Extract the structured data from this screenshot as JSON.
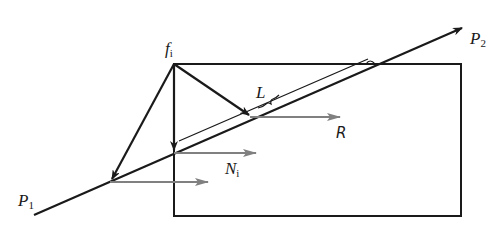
{
  "colors": {
    "stroke": "#1a1a1a",
    "force_arrow": "#808080",
    "background": "#ffffff"
  },
  "labels": {
    "f_i": {
      "main": "f",
      "sub": "i"
    },
    "P2": {
      "main": "P",
      "sub": "2"
    },
    "P1": {
      "main": "P",
      "sub": "1"
    },
    "L": {
      "main": "L"
    },
    "R": {
      "main": "R"
    },
    "N_i": {
      "main": "N",
      "sub": "i"
    }
  },
  "geometry": {
    "rectangle": {
      "x1": 174,
      "y1": 64,
      "x2": 461,
      "y2": 216
    },
    "line_P1_P2": {
      "from": [
        34,
        215
      ],
      "to": [
        462,
        28
      ]
    },
    "apex_f_i": [
      174,
      64
    ]
  }
}
